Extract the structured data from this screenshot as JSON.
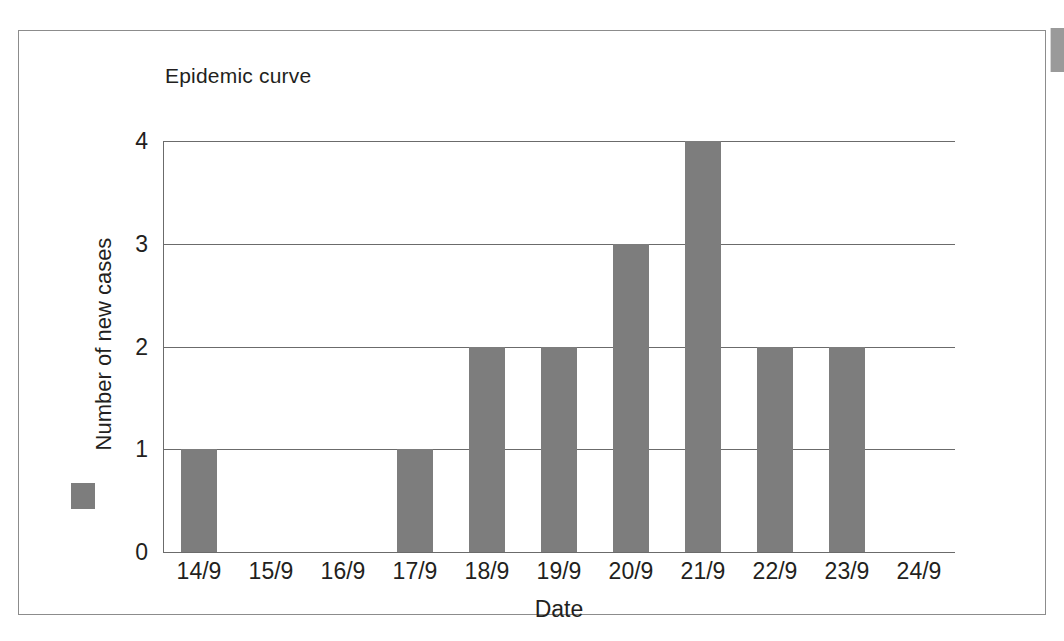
{
  "figure": {
    "title": "Epidemic curve"
  },
  "chart_data": {
    "type": "bar",
    "title": "Epidemic curve",
    "xlabel": "Date",
    "ylabel": "Number of new cases",
    "categories": [
      "14/9",
      "15/9",
      "16/9",
      "17/9",
      "18/9",
      "19/9",
      "20/9",
      "21/9",
      "22/9",
      "23/9",
      "24/9"
    ],
    "values": [
      1,
      0,
      0,
      1,
      2,
      2,
      3,
      4,
      2,
      2,
      0
    ],
    "ylim": [
      0,
      4
    ],
    "yticks": [
      "0",
      "1",
      "2",
      "3",
      "4"
    ],
    "grid": "horizontal",
    "legend": "none",
    "series_color": "#7d7d7d"
  },
  "colors": {
    "bar": "#7d7d7d",
    "axis": "#6b6b6b",
    "text": "#231f20",
    "frame": "#8c8c8c"
  }
}
